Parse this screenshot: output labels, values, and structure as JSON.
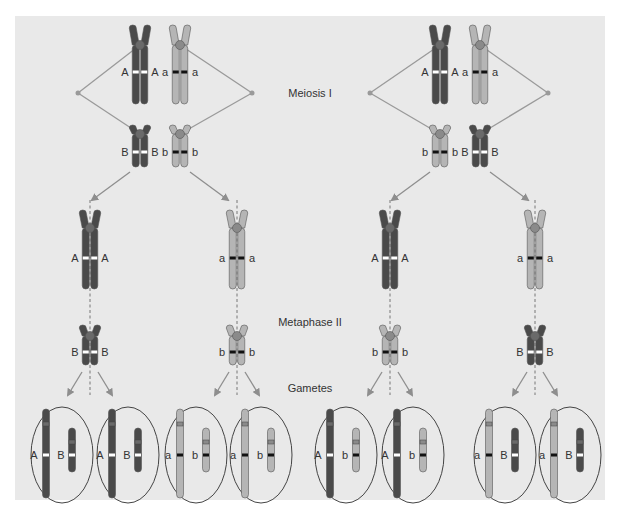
{
  "figure": {
    "stage_labels": {
      "meiosis1": "Meiosis I",
      "metaphase2": "Metaphase II",
      "gametes": "Gametes"
    },
    "colors": {
      "background": "#e9e9e9",
      "dark_chromosome": "#4a4a4a",
      "light_chromosome": "#b5b5b5",
      "centromere_dark": "#6a6a6a",
      "centromere_light": "#8a8a8a",
      "spindle": "#9a9a9a",
      "arrow": "#8e8e8e",
      "allele_dark_band": "#ffffff",
      "allele_light_band": "#111111",
      "outline": "#444444"
    },
    "alleles": {
      "A": "A",
      "a": "a",
      "B": "B",
      "b": "b"
    },
    "meiosis1": [
      {
        "name": "arrangement-1",
        "large_pair": [
          {
            "shade": "dark",
            "allele": "A"
          },
          {
            "shade": "light",
            "allele": "a"
          }
        ],
        "small_pair": [
          {
            "shade": "dark",
            "allele": "B"
          },
          {
            "shade": "light",
            "allele": "b"
          }
        ]
      },
      {
        "name": "arrangement-2",
        "large_pair": [
          {
            "shade": "dark",
            "allele": "A"
          },
          {
            "shade": "light",
            "allele": "a"
          }
        ],
        "small_pair": [
          {
            "shade": "light",
            "allele": "b"
          },
          {
            "shade": "dark",
            "allele": "B"
          }
        ]
      }
    ],
    "metaphase2": [
      {
        "large": {
          "shade": "dark",
          "allele": "A"
        },
        "small": {
          "shade": "dark",
          "allele": "B"
        }
      },
      {
        "large": {
          "shade": "light",
          "allele": "a"
        },
        "small": {
          "shade": "light",
          "allele": "b"
        }
      },
      {
        "large": {
          "shade": "dark",
          "allele": "A"
        },
        "small": {
          "shade": "light",
          "allele": "b"
        }
      },
      {
        "large": {
          "shade": "light",
          "allele": "a"
        },
        "small": {
          "shade": "dark",
          "allele": "B"
        }
      }
    ],
    "gametes": [
      {
        "large": {
          "shade": "dark",
          "allele": "A"
        },
        "small": {
          "shade": "dark",
          "allele": "B"
        }
      },
      {
        "large": {
          "shade": "dark",
          "allele": "A"
        },
        "small": {
          "shade": "dark",
          "allele": "B"
        }
      },
      {
        "large": {
          "shade": "light",
          "allele": "a"
        },
        "small": {
          "shade": "light",
          "allele": "b"
        }
      },
      {
        "large": {
          "shade": "light",
          "allele": "a"
        },
        "small": {
          "shade": "light",
          "allele": "b"
        }
      },
      {
        "large": {
          "shade": "dark",
          "allele": "A"
        },
        "small": {
          "shade": "light",
          "allele": "b"
        }
      },
      {
        "large": {
          "shade": "dark",
          "allele": "A"
        },
        "small": {
          "shade": "light",
          "allele": "b"
        }
      },
      {
        "large": {
          "shade": "light",
          "allele": "a"
        },
        "small": {
          "shade": "dark",
          "allele": "B"
        }
      },
      {
        "large": {
          "shade": "light",
          "allele": "a"
        },
        "small": {
          "shade": "dark",
          "allele": "B"
        }
      }
    ]
  }
}
